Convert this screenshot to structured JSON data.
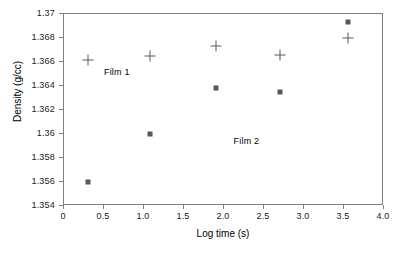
{
  "chart_data": {
    "type": "scatter",
    "title": "",
    "xlabel": "Log time (s)",
    "ylabel": "Density (g/cc)",
    "xlim": [
      0,
      4.0
    ],
    "ylim": [
      1.354,
      1.37
    ],
    "grid": false,
    "legend_position": "inline-annotation",
    "xticks": [
      "0",
      "0.5",
      "1.0",
      "1.5",
      "2.0",
      "2.5",
      "3.0",
      "3.5",
      "4.0"
    ],
    "xtick_values": [
      0,
      0.5,
      1.0,
      1.5,
      2.0,
      2.5,
      3.0,
      3.5,
      4.0
    ],
    "yticks": [
      "1.354",
      "1.356",
      "1.358",
      "1.36",
      "1.362",
      "1.364",
      "1.366",
      "1.368",
      "1.37"
    ],
    "ytick_values": [
      1.354,
      1.356,
      1.358,
      1.36,
      1.362,
      1.364,
      1.366,
      1.368,
      1.37
    ],
    "series": [
      {
        "name": "Film 1",
        "marker": "plus",
        "color": "#595959",
        "x": [
          0.3,
          1.07,
          1.9,
          2.7,
          3.55
        ],
        "y": [
          1.3662,
          1.3665,
          1.3673,
          1.3666,
          1.368
        ]
      },
      {
        "name": "Film 2",
        "marker": "square",
        "color": "#595959",
        "x": [
          0.3,
          1.07,
          1.9,
          2.7,
          3.55
        ],
        "y": [
          1.356,
          1.36,
          1.3638,
          1.3635,
          1.3693
        ]
      }
    ],
    "annotations": [
      {
        "text": "Film 1",
        "x": 0.66,
        "y": 1.3652
      },
      {
        "text": "Film 2",
        "x": 2.28,
        "y": 1.3594
      }
    ]
  }
}
